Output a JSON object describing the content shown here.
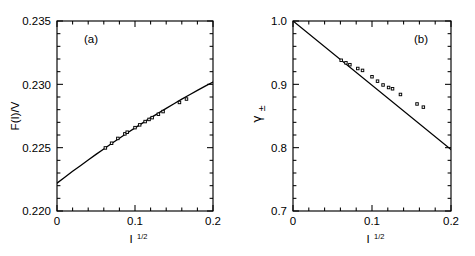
{
  "figure": {
    "background": "#ffffff",
    "foreground": "#000000",
    "width": 475,
    "height": 256
  },
  "chart_data": [
    {
      "type": "scatter",
      "panel_tag": "(a)",
      "title": "",
      "xlabel_base": "I",
      "xlabel_sup": "1/2",
      "ylabel": "F(I)/V",
      "xlim": [
        0,
        0.2
      ],
      "ylim": [
        0.22,
        0.235
      ],
      "xticks": [
        0,
        0.1,
        0.2
      ],
      "xtick_labels": [
        "0",
        "0.1",
        "0.2"
      ],
      "yticks": [
        0.22,
        0.225,
        0.23,
        0.235
      ],
      "ytick_labels": [
        "0.220",
        "0.225",
        "0.230",
        "0.235"
      ],
      "x_minor_step": 0.02,
      "y_minor_step": 0.001,
      "grid": false,
      "legend": "none",
      "series": [
        {
          "name": "fitted curve",
          "style": "line",
          "x": [
            0.0,
            0.01,
            0.02,
            0.03,
            0.04,
            0.05,
            0.06,
            0.07,
            0.08,
            0.09,
            0.1,
            0.11,
            0.12,
            0.13,
            0.14,
            0.15,
            0.16,
            0.17,
            0.18,
            0.19,
            0.2
          ],
          "y": [
            0.2222,
            0.22267,
            0.22313,
            0.22358,
            0.22403,
            0.22447,
            0.2249,
            0.22533,
            0.22575,
            0.22616,
            0.22656,
            0.22696,
            0.22735,
            0.22773,
            0.2281,
            0.22847,
            0.22883,
            0.22918,
            0.22952,
            0.22986,
            0.23018
          ]
        },
        {
          "name": "measured points",
          "style": "markers",
          "marker": "open-square",
          "x": [
            0.062,
            0.07,
            0.078,
            0.087,
            0.09,
            0.1,
            0.106,
            0.113,
            0.118,
            0.122,
            0.13,
            0.136,
            0.157,
            0.166
          ],
          "y": [
            0.22498,
            0.22535,
            0.22573,
            0.22609,
            0.22622,
            0.22658,
            0.2268,
            0.22706,
            0.22723,
            0.22737,
            0.22764,
            0.22785,
            0.22857,
            0.22884
          ]
        }
      ]
    },
    {
      "type": "scatter",
      "panel_tag": "(b)",
      "title": "",
      "xlabel_base": "I",
      "xlabel_sup": "1/2",
      "ylabel_base": "γ",
      "ylabel_sub": "±",
      "xlim": [
        0,
        0.2
      ],
      "ylim": [
        0.7,
        1.0
      ],
      "xticks": [
        0,
        0.1,
        0.2
      ],
      "xtick_labels": [
        "0",
        "0.1",
        "0.2"
      ],
      "yticks": [
        0.7,
        0.8,
        0.9,
        1.0
      ],
      "ytick_labels": [
        "0.7",
        "0.8",
        "0.9",
        "1.0"
      ],
      "x_minor_step": 0.02,
      "y_minor_step": 0.02,
      "grid": false,
      "legend": "none",
      "series": [
        {
          "name": "Debye-Huckel limiting law",
          "style": "line",
          "x": [
            0.0,
            0.2
          ],
          "y": [
            1.0,
            0.797
          ]
        },
        {
          "name": "measured points",
          "style": "markers",
          "marker": "open-square",
          "x": [
            0.061,
            0.067,
            0.072,
            0.082,
            0.088,
            0.1,
            0.107,
            0.114,
            0.121,
            0.126,
            0.136,
            0.157,
            0.165
          ],
          "y": [
            0.938,
            0.934,
            0.931,
            0.925,
            0.922,
            0.912,
            0.905,
            0.899,
            0.895,
            0.893,
            0.884,
            0.869,
            0.864
          ]
        }
      ]
    }
  ]
}
